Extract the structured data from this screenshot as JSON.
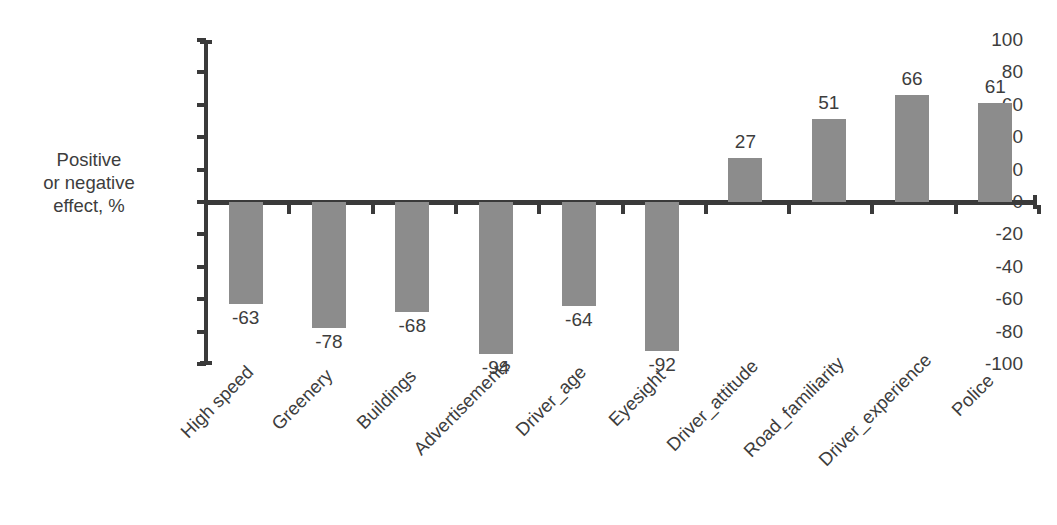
{
  "chart_data": {
    "type": "bar",
    "title": "",
    "xlabel": "",
    "ylabel": "Positive or negative effect, %",
    "ylim": [
      -100,
      100
    ],
    "ytick_step": 20,
    "grid": false,
    "legend": false,
    "bar_color": "#8c8c8c",
    "axis_color": "#3a3a3a",
    "text_color": "#3d3d3d",
    "categories": [
      "High speed",
      "Greenery",
      "Buildings",
      "Advertisements",
      "Driver_age",
      "Eyesight",
      "Driver_attitude",
      "Road_familiarity",
      "Driver_experience",
      "Police"
    ],
    "values": [
      -63,
      -78,
      -68,
      -94,
      -64,
      -92,
      27,
      51,
      66,
      61
    ],
    "data_labels": [
      "-63",
      "-78",
      "-68",
      "-94",
      "-64",
      "-92",
      "27",
      "51",
      "66",
      "61"
    ],
    "yticks": [
      100,
      80,
      60,
      40,
      20,
      0,
      -20,
      -40,
      -60,
      -80,
      -100
    ],
    "ytick_labels": [
      "100",
      "80",
      "60",
      "40",
      "20",
      "0",
      "-20",
      "-40",
      "-60",
      "-80",
      "-100"
    ]
  },
  "axis": {
    "y_label_lines": [
      "Positive",
      "or negative",
      "effect, %"
    ]
  }
}
